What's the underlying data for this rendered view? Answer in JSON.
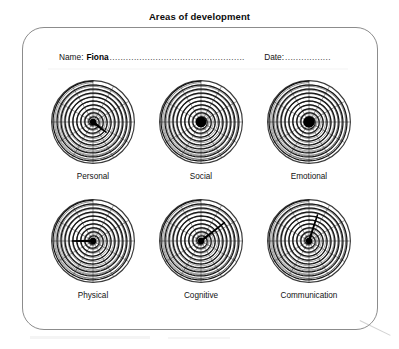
{
  "document": {
    "title": "Areas of development"
  },
  "identity": {
    "name_label": "Name:",
    "name_value": "Fiona",
    "name_leader": "..................................................",
    "date_label": "Date:",
    "date_leader": "................."
  },
  "chart_data": {
    "type": "radar",
    "title": "Areas of development",
    "subtitle": "",
    "xlabel": "",
    "ylabel": "",
    "rings": 10,
    "spokes": 12,
    "value_range": [
      0,
      10
    ],
    "legend_position": "none",
    "grid": true,
    "categories": [
      "Personal",
      "Social",
      "Emotional",
      "Physical",
      "Cognitive",
      "Communication"
    ],
    "values": [
      4,
      1,
      1,
      5,
      7,
      6
    ],
    "series": [
      {
        "name": "Marked level",
        "values": [
          4,
          1,
          1,
          5,
          7,
          6
        ]
      }
    ],
    "marker_angles_deg": [
      -38,
      0,
      0,
      180,
      38,
      72
    ],
    "dials": [
      {
        "label": "Personal",
        "value": 4,
        "marker_angle_deg": -38,
        "marker_length_ratio": 0.4,
        "marker_width_deg": 26
      },
      {
        "label": "Social",
        "value": 1,
        "marker_angle_deg": 0,
        "marker_length_ratio": 0.13,
        "marker_width_deg": 360
      },
      {
        "label": "Emotional",
        "value": 1,
        "marker_angle_deg": 0,
        "marker_length_ratio": 0.14,
        "marker_width_deg": 360
      },
      {
        "label": "Physical",
        "value": 5,
        "marker_angle_deg": 180,
        "marker_length_ratio": 0.5,
        "marker_width_deg": 20
      },
      {
        "label": "Cognitive",
        "value": 7,
        "marker_angle_deg": 38,
        "marker_length_ratio": 0.72,
        "marker_width_deg": 16
      },
      {
        "label": "Communication",
        "value": 6,
        "marker_angle_deg": 72,
        "marker_length_ratio": 0.66,
        "marker_width_deg": 15
      }
    ]
  },
  "colors": {
    "page_background": "#ffffff",
    "panel_border": "#8c8c8c",
    "text": "#111111",
    "dial_grid": "#3a3a3a",
    "dial_spiral": "#151515",
    "dial_marker": "#000000"
  }
}
